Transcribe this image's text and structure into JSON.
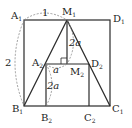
{
  "diagram": {
    "points": {
      "A1": {
        "label": "A",
        "sub": "1"
      },
      "M1": {
        "label": "M",
        "sub": "1"
      },
      "D1": {
        "label": "D",
        "sub": "1"
      },
      "A2": {
        "label": "A",
        "sub": "2"
      },
      "D2": {
        "label": "D",
        "sub": "2"
      },
      "M2": {
        "label": "M",
        "sub": "2"
      },
      "B1": {
        "label": "B",
        "sub": "1"
      },
      "B2": {
        "label": "B",
        "sub": "2"
      },
      "C2": {
        "label": "C",
        "sub": "2"
      },
      "C1": {
        "label": "C",
        "sub": "1"
      }
    },
    "measures": {
      "top": "1",
      "left": "2",
      "center": "2a",
      "small": "a",
      "lower": "2a"
    },
    "colors": {
      "line": "#2a2a2a",
      "dashed": "#888888"
    }
  }
}
